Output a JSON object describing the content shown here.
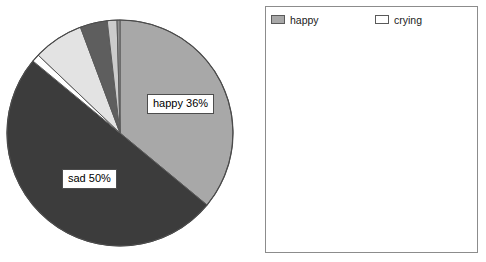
{
  "chart_data": {
    "type": "pie",
    "title": "",
    "categories": [
      "happy",
      "sad",
      "crying",
      "scared",
      "excited",
      "surprised",
      "good",
      "angry",
      "cross",
      "bad",
      "yucky",
      "fine",
      "worried",
      "upset",
      "unsure/missed",
      "frightened",
      "miserable",
      "uncomfortable",
      "worried",
      "afraid",
      "hurt",
      "apprehensive",
      "lonely",
      "sleepy",
      "grumpy",
      "whingey",
      "mixed"
    ],
    "values": [
      36,
      50,
      1,
      1,
      1,
      2,
      1,
      3,
      1,
      1,
      2,
      1,
      1,
      0,
      0,
      0,
      0,
      0,
      0,
      0,
      0,
      0,
      0,
      0,
      0,
      0,
      0
    ],
    "colors": [
      "#a8a8a8",
      "#3c3c3c",
      "#ffffff",
      "#ffffff",
      "#0a0a0a",
      "#8f8f8f",
      "#5e5e5e",
      "#d9d9d9",
      "#141414",
      "#6f6f6f",
      "#ececec",
      "#c2c2c2",
      "#4a4a4a",
      "#101010",
      "#4f4f4f",
      "#464646",
      "#d3d3d3",
      "#fbfbfb",
      "#f2f2f2",
      "#fdfdfd",
      "#e2e2e2",
      "#9a9a9a",
      "#808080",
      "#cfcfcf",
      "#3a3a3a",
      "#dedede",
      "#bdbdbd"
    ],
    "slices": [
      {
        "label": "happy",
        "percent": 36,
        "color": "#a8a8a8",
        "start_deg": 0,
        "end_deg": 129.6
      },
      {
        "label": "sad",
        "percent": 50,
        "color": "#3c3c3c",
        "start_deg": 129.6,
        "end_deg": 309.6
      },
      {
        "label": "crying",
        "percent": 1.1,
        "color": "#ffffff",
        "start_deg": 309.6,
        "end_deg": 313.6
      },
      {
        "label": "yucky",
        "percent": 7.2,
        "color": "#e3e3e3",
        "start_deg": 313.6,
        "end_deg": 339.5
      },
      {
        "label": "good",
        "percent": 3.9,
        "color": "#5e5e5e",
        "start_deg": 339.5,
        "end_deg": 353.5
      },
      {
        "label": "fine",
        "percent": 1.4,
        "color": "#cccccc",
        "start_deg": 353.5,
        "end_deg": 358.5
      },
      {
        "label": "surprised",
        "percent": 0.4,
        "color": "#8f8f8f",
        "start_deg": 358.5,
        "end_deg": 360
      }
    ],
    "labels_shown": [
      {
        "text": "happy 36%",
        "slice": "happy"
      },
      {
        "text": "sad 50%",
        "slice": "sad"
      }
    ],
    "legend": {
      "position": "right",
      "columns": 2,
      "entries": [
        {
          "label": "happy",
          "color": "#a8a8a8"
        },
        {
          "label": "crying",
          "color": "#ffffff"
        },
        {
          "label": "excited",
          "color": "#0a0a0a"
        },
        {
          "label": "good",
          "color": "#5e5e5e"
        },
        {
          "label": "cross",
          "color": "#141414"
        },
        {
          "label": "yucky",
          "color": "#ececec"
        },
        {
          "label": "worried",
          "color": "#4a4a4a"
        },
        {
          "label": "unsure/missed",
          "color": "#4f4f4f"
        },
        {
          "label": "miserable",
          "color": "#d3d3d3"
        },
        {
          "label": "worried",
          "color": "#f2f2f2"
        },
        {
          "label": "hurt",
          "color": "#e2e2e2"
        },
        {
          "label": "lonely",
          "color": "#808080"
        },
        {
          "label": "grumpy",
          "color": "#3a3a3a"
        },
        {
          "label": "mixed",
          "color": "#bdbdbd"
        },
        {
          "label": "sad",
          "color": "#3c3c3c"
        },
        {
          "label": "scared",
          "color": "#ffffff"
        },
        {
          "label": "surprised",
          "color": "#8f8f8f"
        },
        {
          "label": "angry",
          "color": "#d9d9d9"
        },
        {
          "label": "bad",
          "color": "#6f6f6f"
        },
        {
          "label": "fine",
          "color": "#c2c2c2"
        },
        {
          "label": "upset",
          "color": "#101010"
        },
        {
          "label": "frightened",
          "color": "#464646"
        },
        {
          "label": "uncomfortable",
          "color": "#fbfbfb"
        },
        {
          "label": "afraid",
          "color": "#fdfdfd"
        },
        {
          "label": "apprehensive",
          "color": "#9a9a9a"
        },
        {
          "label": "sleepy",
          "color": "#cfcfcf"
        },
        {
          "label": "whingey",
          "color": "#dedede"
        }
      ]
    },
    "geometry": {
      "cx": 120,
      "cy": 133,
      "r": 113
    }
  }
}
